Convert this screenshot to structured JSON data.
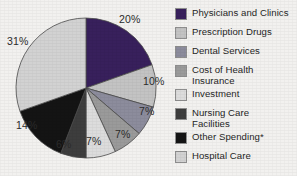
{
  "chart_data": {
    "type": "pie",
    "title": "",
    "subtitle": "",
    "xlabel": "",
    "ylabel": "",
    "legend_position": "right",
    "grid": false,
    "start_angle_deg": 0,
    "direction": "clockwise",
    "categories": [
      "Physicians and Clinics",
      "Prescription Drugs",
      "Dental Services",
      "Cost of Health Insurance",
      "Investment",
      "Nursing Care Facilities",
      "Other Spending*",
      "Hospital Care"
    ],
    "values": [
      20,
      10,
      7,
      7,
      7,
      6,
      14,
      31
    ],
    "value_labels": [
      "20%",
      "10%",
      "7%",
      "7%",
      "7%",
      "6%",
      "14%",
      "31%"
    ],
    "colors": [
      "#38205c",
      "#c3c3c3",
      "#8c8c9c",
      "#9a9a9a",
      "#dcdcdc",
      "#3d3d3d",
      "#141414",
      "#d2d2d2"
    ],
    "slice_border_color": "#4a4a4a",
    "footnote_marker": "*"
  },
  "legend": {
    "items": [
      {
        "label": "Physicians and Clinics",
        "color": "#38205c",
        "value_label": "20%"
      },
      {
        "label": "Prescription Drugs",
        "color": "#c3c3c3",
        "value_label": "10%"
      },
      {
        "label": "Dental Services",
        "color": "#8c8c9c",
        "value_label": "7%"
      },
      {
        "label": "Cost of Health\nInsurance",
        "color": "#9a9a9a",
        "value_label": "7%"
      },
      {
        "label": "Investment",
        "color": "#dcdcdc",
        "value_label": "7%"
      },
      {
        "label": "Nursing Care\nFacilities",
        "color": "#3d3d3d",
        "value_label": "6%"
      },
      {
        "label": "Other Spending*",
        "color": "#141414",
        "value_label": "14%"
      },
      {
        "label": "Hospital Care",
        "color": "#d2d2d2",
        "value_label": "31%"
      }
    ]
  },
  "pie_labels": [
    {
      "text": "20%",
      "left": 119,
      "top": 14
    },
    {
      "text": "10%",
      "left": 143,
      "top": 76
    },
    {
      "text": "7%",
      "left": 139,
      "top": 106
    },
    {
      "text": "7%",
      "left": 115,
      "top": 129
    },
    {
      "text": "7%",
      "left": 86,
      "top": 136
    },
    {
      "text": "6%",
      "left": 56,
      "top": 139
    },
    {
      "text": "14%",
      "left": 16,
      "top": 120
    },
    {
      "text": "31%",
      "left": 7,
      "top": 36
    }
  ]
}
